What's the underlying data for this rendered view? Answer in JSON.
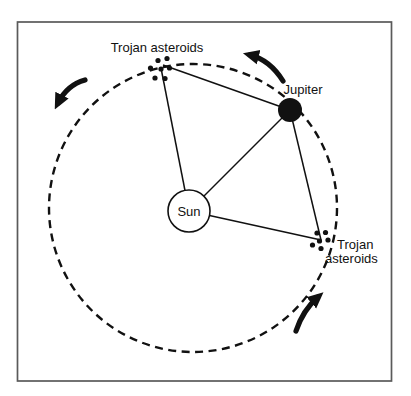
{
  "figure": {
    "background_color": "#ffffff",
    "frame_color": "#5a5a5a",
    "ink_color": "#111111",
    "sun_fill_color": "#ffffff"
  },
  "labels": {
    "trojan_leading": "Trojan asteroids",
    "jupiter": "Jupiter",
    "sun": "Sun",
    "trojan_trailing_line1": "Trojan",
    "trojan_trailing_line2": "asteroids"
  },
  "icons": {
    "orbit": "dashed-orbit-circle",
    "sun": "sun-circle",
    "jupiter": "jupiter-filled-dot",
    "trojan_clusters": "asteroid-dot-cluster",
    "direction_arrows": "counterclockwise-orbit-arrow"
  }
}
